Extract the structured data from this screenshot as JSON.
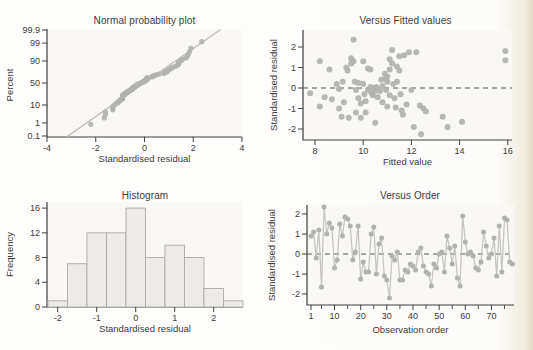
{
  "colors": {
    "dot": "#b1b1af",
    "order_line": "#c6c4c0",
    "fit_line": "#bfbbb1",
    "dashed_zero": "#565654",
    "bar_fill": "#edebe8",
    "bar_edge": "#acaaa7",
    "axis": "#3f3f3f",
    "text": "#3b3b3b",
    "plot_bg": "#f9f8f5"
  },
  "chart_data": [
    {
      "id": "normal_probability",
      "type": "scatter",
      "title": "Normal probability plot",
      "xlabel": "Standardised residual",
      "ylabel": "Percent",
      "xlim": [
        -4,
        4
      ],
      "x_ticks": [
        -4,
        -2,
        0,
        2,
        4
      ],
      "y_scale": "normal_probability_percent",
      "y_tick_percents": [
        0.1,
        1,
        10,
        50,
        90,
        99,
        99.9
      ],
      "points_note": "sorted residuals (from versus_order values) plotted at Blom percentiles (i-0.375)/(n+0.25)",
      "fit_line": {
        "slope": 1,
        "intercept": 0,
        "x_start": -3.2,
        "x_end": 3.12
      }
    },
    {
      "id": "versus_fitted",
      "type": "scatter",
      "title": "Versus Fitted values",
      "xlabel": "Fitted value",
      "ylabel": "Standardised residual",
      "xlim": [
        7.5,
        16.2
      ],
      "x_ticks": [
        8,
        10,
        12,
        14,
        16
      ],
      "ylim": [
        -2.55,
        2.7
      ],
      "y_ticks": [
        -2,
        -1,
        0,
        1,
        2
      ],
      "zero_line": true,
      "points": [
        [
          7.8,
          -0.25
        ],
        [
          8.2,
          1.3
        ],
        [
          8.2,
          -0.9
        ],
        [
          8.4,
          -0.45
        ],
        [
          8.6,
          0.9
        ],
        [
          8.7,
          -0.55
        ],
        [
          8.9,
          0.2
        ],
        [
          9.0,
          -0.05
        ],
        [
          9.0,
          -1.0
        ],
        [
          9.1,
          -1.4
        ],
        [
          9.15,
          0.3
        ],
        [
          9.2,
          -0.7
        ],
        [
          9.3,
          1.0
        ],
        [
          9.35,
          0.85
        ],
        [
          9.4,
          -1.45
        ],
        [
          9.5,
          1.45
        ],
        [
          9.5,
          1.2
        ],
        [
          9.6,
          1.3
        ],
        [
          9.6,
          2.35
        ],
        [
          9.65,
          0.3
        ],
        [
          9.7,
          -0.1
        ],
        [
          9.7,
          -1.2
        ],
        [
          9.8,
          0.25
        ],
        [
          9.8,
          -0.5
        ],
        [
          9.9,
          -0.75
        ],
        [
          9.9,
          -1.45
        ],
        [
          10.0,
          1.3
        ],
        [
          10.0,
          0.2
        ],
        [
          10.05,
          -0.3
        ],
        [
          10.1,
          -0.65
        ],
        [
          10.1,
          -1.2
        ],
        [
          10.2,
          0.95
        ],
        [
          10.2,
          -0.1
        ],
        [
          10.3,
          0.9
        ],
        [
          10.3,
          0.05
        ],
        [
          10.35,
          -0.25
        ],
        [
          10.4,
          -0.35
        ],
        [
          10.45,
          0.0
        ],
        [
          10.5,
          -0.15
        ],
        [
          10.5,
          -1.7
        ],
        [
          10.55,
          0.05
        ],
        [
          10.6,
          -0.45
        ],
        [
          10.7,
          -0.15
        ],
        [
          10.75,
          0.4
        ],
        [
          10.8,
          0.1
        ],
        [
          10.8,
          -0.7
        ],
        [
          10.9,
          0.7
        ],
        [
          10.9,
          0.45
        ],
        [
          10.95,
          -0.1
        ],
        [
          11.0,
          0.55
        ],
        [
          11.0,
          0.3
        ],
        [
          11.0,
          -0.9
        ],
        [
          11.1,
          1.4
        ],
        [
          11.1,
          0.9
        ],
        [
          11.1,
          -0.35
        ],
        [
          11.2,
          1.85
        ],
        [
          11.2,
          1.2
        ],
        [
          11.25,
          0.2
        ],
        [
          11.3,
          -0.5
        ],
        [
          11.35,
          -0.95
        ],
        [
          11.4,
          1.05
        ],
        [
          11.4,
          0.3
        ],
        [
          11.5,
          1.55
        ],
        [
          11.5,
          0.85
        ],
        [
          11.55,
          -0.3
        ],
        [
          11.6,
          -1.1
        ],
        [
          11.65,
          -1.3
        ],
        [
          11.7,
          1.6
        ],
        [
          11.8,
          -0.8
        ],
        [
          11.9,
          1.75
        ],
        [
          12.0,
          -0.1
        ],
        [
          12.1,
          -1.9
        ],
        [
          12.2,
          1.75
        ],
        [
          12.35,
          -0.85
        ],
        [
          12.4,
          -2.25
        ],
        [
          12.5,
          -1.0
        ],
        [
          12.6,
          -1.15
        ],
        [
          13.3,
          -1.4
        ],
        [
          13.5,
          -1.9
        ],
        [
          14.1,
          -1.65
        ],
        [
          15.9,
          1.8
        ],
        [
          15.9,
          1.35
        ]
      ]
    },
    {
      "id": "histogram",
      "type": "bar",
      "title": "Histogram",
      "xlabel": "Standardised residual",
      "ylabel": "Frequency",
      "bin_start": -2.25,
      "bin_width": 0.5,
      "frequencies": [
        1,
        7,
        12,
        12,
        16,
        8,
        10,
        8,
        3,
        1
      ],
      "x_ticks": [
        -2,
        -1,
        0,
        1,
        2
      ],
      "y_ticks": [
        0,
        4,
        8,
        12,
        16
      ],
      "ylim": [
        0,
        17
      ]
    },
    {
      "id": "versus_order",
      "type": "line",
      "title": "Versus Order",
      "xlabel": "Observation order",
      "ylabel": "Standardised residual",
      "x_ticks": [
        1,
        10,
        20,
        30,
        40,
        50,
        60,
        70
      ],
      "x_minor_ticks": [
        5,
        15,
        25,
        35,
        45,
        55,
        65,
        75
      ],
      "ylim": [
        -2.55,
        2.5
      ],
      "y_ticks": [
        -2,
        -1,
        0,
        1,
        2
      ],
      "zero_line": true,
      "values": [
        0.9,
        1.1,
        -0.2,
        1.2,
        -1.65,
        2.35,
        1.0,
        1.55,
        1.3,
        -0.7,
        -0.3,
        1.5,
        0.9,
        1.85,
        1.75,
        1.4,
        -0.3,
        0.1,
        1.4,
        -1.25,
        -0.4,
        -0.9,
        -0.9,
        1.0,
        1.35,
        -1.0,
        0.5,
        0.8,
        -1.1,
        -1.3,
        -2.2,
        -0.1,
        -0.3,
        0.1,
        -1.3,
        -1.3,
        -0.8,
        -0.9,
        -0.5,
        -0.6,
        -0.8,
        0.1,
        0.3,
        -0.6,
        -0.9,
        -1.0,
        -1.6,
        -0.5,
        -0.7,
        0.0,
        0.1,
        -0.9,
        0.9,
        0.3,
        -0.5,
        0.4,
        -1.2,
        -1.6,
        1.9,
        0.6,
        0.0,
        0.1,
        -0.1,
        -0.7,
        -0.8,
        -0.4,
        1.1,
        0.4,
        -0.2,
        0.0,
        0.8,
        -1.1,
        1.4,
        -0.9,
        1.8,
        1.7,
        -0.4,
        -0.5
      ]
    }
  ]
}
